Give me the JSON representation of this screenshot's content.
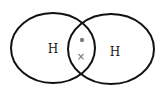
{
  "diagram": {
    "type": "dot-and-cross",
    "molecule": "H2",
    "stroke_color": "#111111",
    "electron_color": "#777777",
    "atoms": [
      {
        "label": "H",
        "shell": {
          "cx": 53,
          "cy": 48,
          "rx": 42,
          "ry": 35
        },
        "label_pos": {
          "x": 53,
          "y": 49
        }
      },
      {
        "label": "H",
        "shell": {
          "cx": 111,
          "cy": 49,
          "rx": 43,
          "ry": 35
        },
        "label_pos": {
          "x": 115,
          "y": 52
        }
      }
    ],
    "shared_electrons": [
      {
        "symbol": "dot",
        "owner": "left",
        "x": 82,
        "y": 40
      },
      {
        "symbol": "×",
        "owner": "right",
        "x": 81,
        "y": 57
      }
    ]
  }
}
